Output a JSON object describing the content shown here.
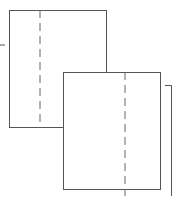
{
  "diagram": {
    "width": 177,
    "height": 196,
    "stroke_color": "#555555",
    "dash_color": "#666666",
    "shapes": [
      {
        "id": "back-sheet",
        "x": 9,
        "y": 10,
        "w": 97,
        "h": 117,
        "fold_x": 40
      },
      {
        "id": "front-sheet",
        "x": 63,
        "y": 72,
        "w": 97,
        "h": 117,
        "fold_x": 125
      }
    ],
    "left_tick": {
      "x1": 0,
      "y1": 45,
      "x2": 5,
      "y2": 45
    },
    "right_bracket": {
      "x_start": 165,
      "y": 85,
      "x_line": 171,
      "y_end": 196
    }
  }
}
